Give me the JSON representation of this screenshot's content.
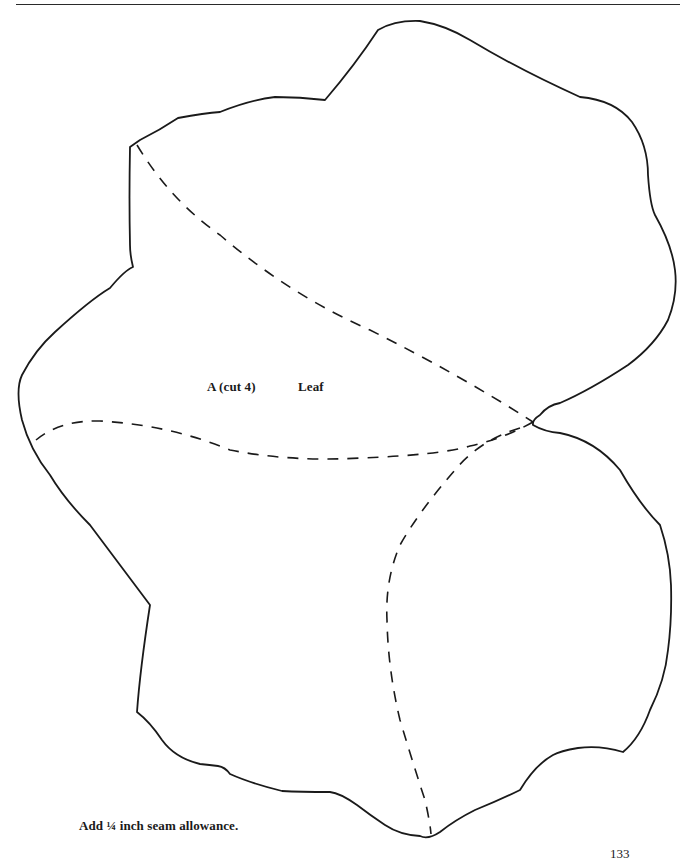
{
  "page": {
    "page_number": "133"
  },
  "pattern_piece": {
    "piece_label": "A (cut 4)",
    "piece_name": "Leaf",
    "outline_style": "solid",
    "stitch_lines_style": "dashed"
  },
  "instructions": {
    "seam_allowance_note": "Add ¼ inch seam allowance."
  },
  "colors": {
    "background": "#ffffff",
    "ink": "#1a1a1a"
  }
}
